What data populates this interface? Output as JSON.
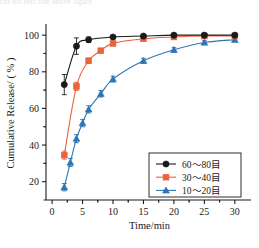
{
  "caption_strip": "cut-off text line above figure",
  "axes": {
    "x_title": "Time/min",
    "y_title": "Cumulative Release/ ( % )",
    "x_ticks": [
      "0",
      "5",
      "10",
      "15",
      "20",
      "25",
      "30"
    ],
    "y_ticks": [
      "20",
      "40",
      "60",
      "80",
      "100"
    ]
  },
  "legend": {
    "entries": [
      {
        "label": "60～80目",
        "color": "#1a1a1a",
        "marker": "circle"
      },
      {
        "label": "30～40目",
        "color": "#e8633a",
        "marker": "square"
      },
      {
        "label": "10～20目",
        "color": "#2e75b6",
        "marker": "triangle"
      }
    ]
  },
  "colors": {
    "black": "#1a1a1a",
    "orange": "#e8633a",
    "blue": "#2e75b6",
    "axis": "#1a1a1a",
    "background": "#ffffff"
  },
  "chart_data": {
    "type": "line",
    "title": "",
    "xlabel": "Time/min",
    "ylabel": "Cumulative Release/ ( % )",
    "xlim": [
      -1,
      32
    ],
    "ylim": [
      10,
      105
    ],
    "grid": false,
    "legend_position": "bottom-right",
    "x_ticks": [
      0,
      5,
      10,
      15,
      20,
      25,
      30
    ],
    "y_ticks": [
      20,
      40,
      60,
      80,
      100
    ],
    "series": [
      {
        "name": "60～80目",
        "color": "#1a1a1a",
        "marker": "circle",
        "x": [
          2,
          4,
          6,
          10,
          15,
          20,
          25,
          30
        ],
        "values": [
          73,
          94,
          97.5,
          99,
          99.5,
          100,
          100,
          100
        ],
        "yerr": [
          5.5,
          4.5,
          1.5,
          0.8,
          0.6,
          0.5,
          0.5,
          0.5
        ]
      },
      {
        "name": "30～40目",
        "color": "#e8633a",
        "marker": "square",
        "x": [
          2,
          4,
          6,
          8,
          10,
          15,
          20,
          25,
          30
        ],
        "values": [
          34.5,
          72,
          86,
          91.5,
          95.5,
          98,
          99,
          99.5,
          99.5
        ],
        "yerr": [
          2.2,
          2.2,
          1.5,
          1.2,
          1.0,
          0.8,
          0.6,
          0.5,
          0.5
        ]
      },
      {
        "name": "10～20目",
        "color": "#2e75b6",
        "marker": "triangle",
        "x": [
          2,
          3,
          4,
          5,
          6,
          8,
          10,
          15,
          20,
          25,
          30
        ],
        "values": [
          17,
          30.5,
          43.5,
          52,
          59.5,
          68,
          76,
          86,
          92,
          96,
          97.5
        ],
        "yerr": [
          2.0,
          2.2,
          2.2,
          2.0,
          2.0,
          1.8,
          1.6,
          1.4,
          1.2,
          1.0,
          0.9
        ]
      }
    ]
  }
}
